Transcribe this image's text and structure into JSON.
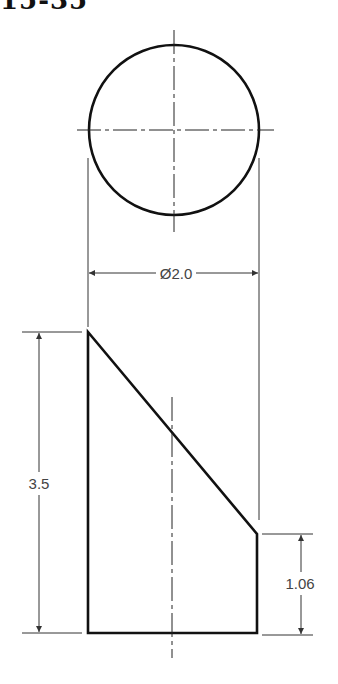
{
  "figure": {
    "title_partial": "15-35",
    "top_view": {
      "shape": "circle",
      "diameter_label": "Ø2.0"
    },
    "front_view": {
      "shape": "truncated cylinder with slanted top",
      "height_label": "3.5",
      "short_side_label": "1.06"
    }
  },
  "colors": {
    "object_line": "#111111",
    "dimension_line": "#333333",
    "dimension_text": "#444444",
    "background": "#ffffff"
  }
}
